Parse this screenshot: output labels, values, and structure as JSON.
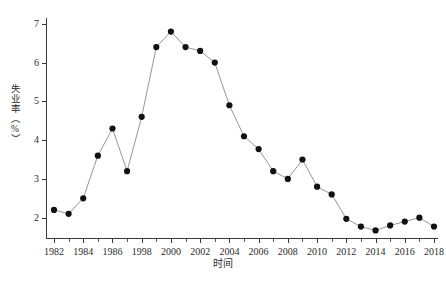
{
  "chart_data": {
    "type": "line",
    "title": "",
    "xlabel": "时间",
    "ylabel": "失业率（%）",
    "ylim": [
      1.45,
      7.15
    ],
    "yticks": [
      2,
      3,
      4,
      5,
      6,
      7
    ],
    "ytick_labels": [
      "2",
      "3",
      "4",
      "5",
      "6",
      "7"
    ],
    "xlim": [
      1982,
      2018
    ],
    "xtick_labels": [
      "1982",
      "1984",
      "1986",
      "1998",
      "2000",
      "2002",
      "2004",
      "2006",
      "2008",
      "2010",
      "2012",
      "2014",
      "2016",
      "2018"
    ],
    "xtick_values": [
      1982,
      1984,
      1986,
      1988,
      1990,
      1992,
      1994,
      1996,
      1998,
      2000,
      2002,
      2004,
      2006,
      2008
    ],
    "grid": false,
    "legend": null,
    "marker": "filled-circle",
    "marker_color": "#111111",
    "line_color": "#8a8a8a",
    "x": [
      1982,
      1983,
      1984,
      1985,
      1986,
      1987,
      1988,
      1989,
      1990,
      1991,
      1992,
      1993,
      1994,
      1995,
      1996,
      1997,
      1998,
      1999,
      2000,
      2001,
      2002,
      2003,
      2004,
      2005,
      2006,
      2007,
      2008
    ],
    "values": [
      2.2,
      2.1,
      2.5,
      3.6,
      4.3,
      3.2,
      4.6,
      6.4,
      6.8,
      6.4,
      6.3,
      6.0,
      4.9,
      4.1,
      3.77,
      3.2,
      3.0,
      3.5,
      2.8,
      2.6,
      1.97,
      1.77,
      1.67,
      1.8,
      1.9,
      2.0,
      1.77
    ],
    "series": [
      {
        "name": "失业率（%）",
        "values": [
          2.2,
          2.1,
          2.5,
          3.6,
          4.3,
          3.2,
          4.6,
          6.4,
          6.8,
          6.4,
          6.3,
          6.0,
          4.9,
          4.1,
          3.77,
          3.2,
          3.0,
          3.5,
          2.8,
          2.6,
          1.97,
          1.77,
          1.67,
          1.8,
          1.9,
          2.0,
          1.77
        ]
      }
    ]
  },
  "figure": {
    "x_axis_title": "时间",
    "y_axis_title": "失业率（%）",
    "caption": ""
  }
}
